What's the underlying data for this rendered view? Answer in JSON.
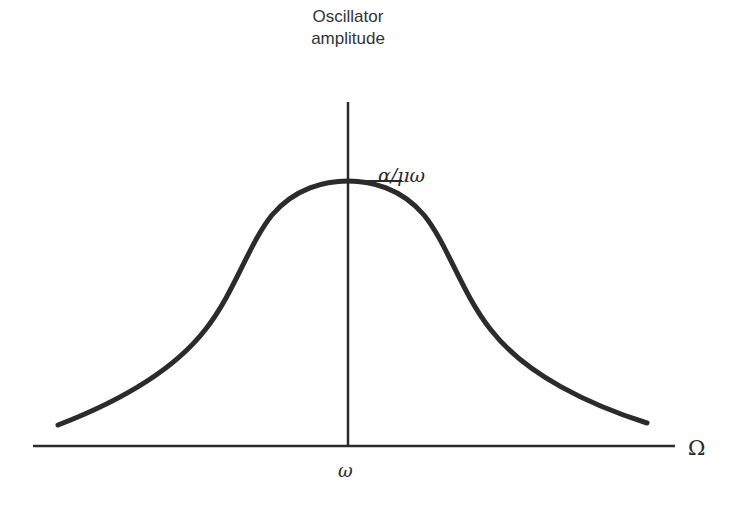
{
  "diagram": {
    "y_axis_label_line1": "Oscillator",
    "y_axis_label_line2": "amplitude",
    "peak_label": "α/μω",
    "x_axis_label": "Ω",
    "x_tick_label": "ω",
    "curve_type": "resonance peak",
    "colors": {
      "line": "#2b2b2b",
      "text": "#333333",
      "background": "#ffffff"
    }
  }
}
